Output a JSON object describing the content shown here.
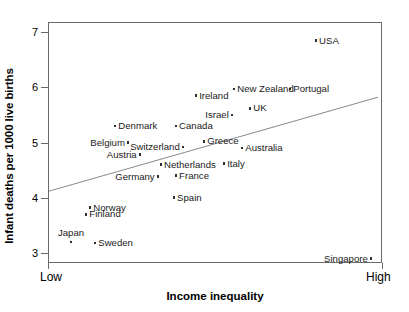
{
  "chart_data": {
    "type": "scatter",
    "title": "",
    "xlabel": "Income inequality",
    "ylabel": "Infant deaths per 1000 live births",
    "x_tick_labels": [
      "Low",
      "High"
    ],
    "y_tick_labels": [
      "3",
      "4",
      "5",
      "6",
      "7"
    ],
    "y_ticks": [
      3,
      4,
      5,
      6,
      7
    ],
    "ylim": [
      2.82,
      7.18
    ],
    "xlim": [
      0,
      100
    ],
    "grid": false,
    "legend": null,
    "trendline": {
      "label": "linear fit",
      "x": [
        0.3,
        98.8
      ],
      "y": [
        4.12,
        5.82
      ]
    },
    "points": [
      {
        "name": "USA",
        "x": 80.2,
        "y": 6.84,
        "label_pos": "right"
      },
      {
        "name": "New Zealand",
        "x": 55.7,
        "y": 5.97,
        "label_pos": "right"
      },
      {
        "name": "Portugal",
        "x": 72.5,
        "y": 5.97,
        "label_pos": "right"
      },
      {
        "name": "Ireland",
        "x": 44.3,
        "y": 5.85,
        "label_pos": "right"
      },
      {
        "name": "UK",
        "x": 60.5,
        "y": 5.62,
        "label_pos": "right"
      },
      {
        "name": "Israel",
        "x": 55.1,
        "y": 5.5,
        "label_pos": "left"
      },
      {
        "name": "Denmark",
        "x": 20.1,
        "y": 5.3,
        "label_pos": "right"
      },
      {
        "name": "Canada",
        "x": 38.3,
        "y": 5.3,
        "label_pos": "right"
      },
      {
        "name": "Greece",
        "x": 46.7,
        "y": 5.02,
        "label_pos": "right"
      },
      {
        "name": "Belgium",
        "x": 24.0,
        "y": 5.0,
        "label_pos": "left"
      },
      {
        "name": "Switzerland",
        "x": 40.4,
        "y": 4.92,
        "label_pos": "left"
      },
      {
        "name": "Australia",
        "x": 58.1,
        "y": 4.9,
        "label_pos": "right"
      },
      {
        "name": "Austria",
        "x": 27.5,
        "y": 4.78,
        "label_pos": "left"
      },
      {
        "name": "Netherlands",
        "x": 33.8,
        "y": 4.6,
        "label_pos": "right"
      },
      {
        "name": "Italy",
        "x": 52.7,
        "y": 4.62,
        "label_pos": "right"
      },
      {
        "name": "France",
        "x": 38.3,
        "y": 4.4,
        "label_pos": "right"
      },
      {
        "name": "Germany",
        "x": 32.9,
        "y": 4.38,
        "label_pos": "left"
      },
      {
        "name": "Spain",
        "x": 37.7,
        "y": 4.0,
        "label_pos": "right"
      },
      {
        "name": "Norway",
        "x": 12.6,
        "y": 3.82,
        "label_pos": "right"
      },
      {
        "name": "Finland",
        "x": 11.4,
        "y": 3.7,
        "label_pos": "right"
      },
      {
        "name": "Sweden",
        "x": 14.1,
        "y": 3.18,
        "label_pos": "right"
      },
      {
        "name": "Japan",
        "x": 6.9,
        "y": 3.2,
        "label_pos": "above"
      },
      {
        "name": "Singapore",
        "x": 96.7,
        "y": 2.9,
        "label_pos": "left"
      }
    ],
    "colors": {
      "point": "#2f2f2f",
      "axis": "#6a6a6a",
      "trendline": "#8a8a8a",
      "text": "#1a1a1a",
      "background": "#ffffff"
    }
  }
}
